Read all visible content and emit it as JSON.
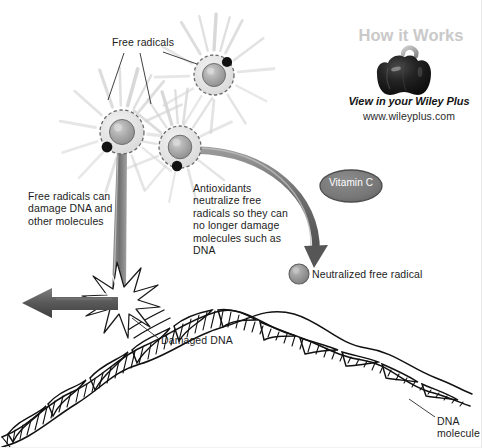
{
  "figure": {
    "background_color": "#ffffff"
  },
  "branding": {
    "how_it_works": "How it Works",
    "view_line": "View in your Wiley Plus",
    "url": "www.wileyplus.com",
    "logo_icon": "bell-pepper-icon",
    "how_it_works_color": "#c9c9c9"
  },
  "labels": {
    "free_radicals": "Free radicals",
    "free_radicals_damage": "Free radicals can\ndamage DNA and\nother molecules",
    "antioxidants": "Antioxidants\nneutralize free\nradicals so they can\nno longer damage\nmolecules such as\nDNA",
    "vitamin_c": "Vitamin C",
    "neutralized_free_radical": "Neutralized free radical",
    "damaged_dna": "Damaged DNA",
    "dna_molecule": "DNA\nmolecule"
  },
  "colors": {
    "text": "#1c1c1c",
    "vitamin_c_fill": "#7a7a7a",
    "vitamin_c_stroke": "#4d4d4d",
    "vitamin_c_text": "#ffffff",
    "radical_core": "#9b9b9b",
    "radical_ring": "#6b6b6b",
    "electron_dot": "#111111",
    "arrow_gray": "#6f6f6f",
    "dna_outline": "#111111",
    "glow": "#d8d8d8"
  },
  "elements": {
    "free_radical_count": 3,
    "free_radicals": [
      {
        "name": "free-radical-upper-right",
        "cx": 214,
        "cy": 75,
        "r": 20,
        "electron_angle_deg": -55
      },
      {
        "name": "free-radical-left",
        "cx": 122,
        "cy": 132,
        "r": 22,
        "electron_angle_deg": 215
      },
      {
        "name": "free-radical-lower-middle",
        "cx": 180,
        "cy": 147,
        "r": 21,
        "electron_angle_deg": 250
      }
    ],
    "neutralized_radical": {
      "name": "neutralized-radical",
      "cx": 299,
      "cy": 274,
      "r": 10
    },
    "vitamin_c_oval": {
      "cx": 351,
      "cy": 186,
      "rx": 31,
      "ry": 16
    },
    "damage_burst": {
      "cx": 117,
      "cy": 303
    },
    "leader_lines": 3
  }
}
